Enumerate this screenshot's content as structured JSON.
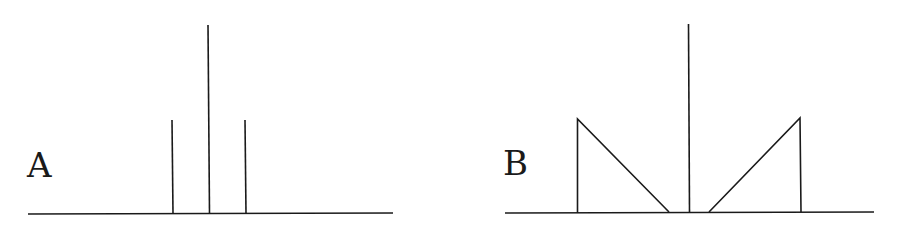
{
  "panels": [
    {
      "label": "A",
      "description": "Three discrete vertical lines (spectral lines): a tall central line flanked by two shorter lines",
      "baseline": {
        "x1": 28,
        "x2": 393,
        "y": 214
      },
      "lines": [
        {
          "x": 172,
          "top": 120
        },
        {
          "x": 209,
          "top": 25
        },
        {
          "x": 245,
          "top": 120
        }
      ]
    },
    {
      "label": "B",
      "description": "Tall central line flanked by two right-triangle shaped bands (continuous distributions) sloping toward the center",
      "baseline": {
        "x1": 505,
        "x2": 874,
        "y": 212
      },
      "center_line": {
        "x": 689,
        "top": 24
      },
      "left_triangle": {
        "vertical_x": 577,
        "top": 119,
        "foot_x": 669
      },
      "right_triangle": {
        "vertical_x": 800,
        "top": 118,
        "foot_x": 709
      }
    }
  ],
  "colors": {
    "stroke": "#1a1a1a",
    "background": "#ffffff"
  }
}
